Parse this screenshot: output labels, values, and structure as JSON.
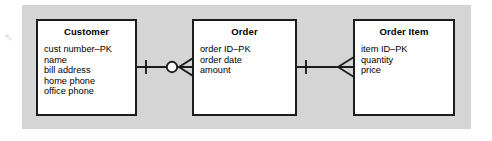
{
  "diagram": {
    "type": "entity-relationship-diagram",
    "notation": "crow's foot",
    "background_color": "#d5d5d5",
    "entity_fill_color": "#ffffff",
    "line_color": "#1d1d1d",
    "artifact_glyph": "↖",
    "entities": [
      {
        "id": "customer",
        "name": "Customer",
        "attributes": [
          "cust number–PK",
          "name",
          "bill address",
          "home phone",
          "office phone"
        ]
      },
      {
        "id": "order",
        "name": "Order",
        "attributes": [
          "order ID–PK",
          "order date",
          "amount"
        ]
      },
      {
        "id": "order-item",
        "name": "Order Item",
        "attributes": [
          "item ID–PK",
          "quantity",
          "price"
        ]
      }
    ],
    "relationships": [
      {
        "id": "customer-order",
        "from": "Customer",
        "to": "Order",
        "from_cardinality": "one",
        "from_symbol": "single-tick",
        "to_cardinality": "zero-or-many",
        "to_symbol": "circle-crowsfoot"
      },
      {
        "id": "order-orderitem",
        "from": "Order",
        "to": "Order Item",
        "from_cardinality": "one",
        "from_symbol": "single-tick",
        "to_cardinality": "many",
        "to_symbol": "crowsfoot"
      }
    ]
  }
}
